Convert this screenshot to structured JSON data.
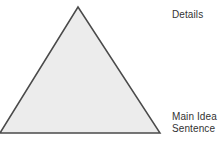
{
  "canvas": {
    "width": 224,
    "height": 144,
    "background_color": "#ffffff"
  },
  "diagram": {
    "type": "triangle-hierarchy",
    "shape_name": "triangle",
    "fill_color": "#ececec",
    "stroke_color": "#4a4a4a",
    "stroke_width": 1.5,
    "vertices": {
      "apex": {
        "x": 78,
        "y": 7
      },
      "bottom_left": {
        "x": 0,
        "y": 133
      },
      "bottom_right": {
        "x": 160,
        "y": 133
      }
    },
    "points_path": "78,7 160,133 0,133"
  },
  "labels": {
    "top": {
      "text": "Details",
      "x": 172,
      "y": 9,
      "color": "#333333"
    },
    "bottom": {
      "line1": "Main Idea",
      "line2": "Sentence",
      "x": 172,
      "y": 111,
      "color": "#333333"
    }
  }
}
